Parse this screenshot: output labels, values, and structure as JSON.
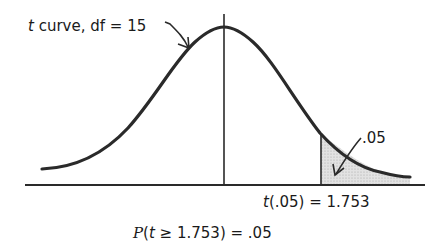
{
  "diagram": {
    "type": "t-distribution",
    "curve_label_prefix": "t",
    "curve_label_rest": " curve, df = 15",
    "tail_area_label": ".05",
    "critical_label_prefix": "t",
    "critical_label_rest": "(.05) = 1.753",
    "probability_p": "P",
    "probability_open": "(",
    "probability_t": "t",
    "probability_rest": " ≥ 1.753) = .05",
    "df": 15,
    "alpha": 0.05,
    "critical_value": 1.753,
    "colors": {
      "line": "#2a2a2a",
      "shade": "#d9d9d9",
      "text": "#1a1a1a"
    }
  }
}
